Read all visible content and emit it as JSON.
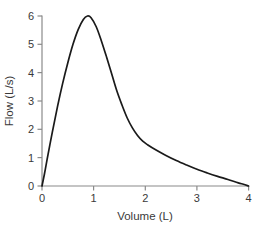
{
  "chart_data": {
    "type": "line",
    "title": "",
    "xlabel": "Volume (L)",
    "ylabel": "Flow (L/s)",
    "xlim": [
      0,
      4
    ],
    "ylim": [
      0,
      6
    ],
    "xticks": [
      "0",
      "1",
      "2",
      "3",
      "4"
    ],
    "yticks": [
      "0",
      "1",
      "2",
      "3",
      "4",
      "5",
      "6"
    ],
    "xtick_values": [
      0,
      1,
      2,
      3,
      4
    ],
    "ytick_values": [
      0,
      1,
      2,
      3,
      4,
      5,
      6
    ],
    "grid": false,
    "legend": null,
    "series": [
      {
        "name": "Expiratory flow-volume curve",
        "color": "#1a1a1a",
        "x": [
          0.0,
          0.05,
          0.1,
          0.2,
          0.3,
          0.4,
          0.5,
          0.6,
          0.7,
          0.8,
          0.88,
          0.95,
          1.05,
          1.15,
          1.25,
          1.35,
          1.45,
          1.55,
          1.65,
          1.75,
          1.85,
          1.95,
          2.05,
          2.2,
          2.4,
          2.6,
          2.8,
          3.0,
          3.2,
          3.4,
          3.6,
          3.8,
          3.9,
          4.0
        ],
        "y": [
          0.0,
          0.45,
          0.95,
          1.9,
          2.8,
          3.62,
          4.35,
          5.0,
          5.52,
          5.88,
          6.0,
          5.94,
          5.62,
          5.12,
          4.55,
          3.95,
          3.35,
          2.85,
          2.4,
          2.05,
          1.78,
          1.58,
          1.45,
          1.28,
          1.08,
          0.9,
          0.74,
          0.59,
          0.46,
          0.34,
          0.23,
          0.11,
          0.06,
          0.0
        ]
      }
    ]
  },
  "axes": {
    "x_title": "Volume (L)",
    "y_title": "Flow (L/s)",
    "axis_color": "#8a8a8a",
    "text_color": "#3a3a3a"
  },
  "ticks": {
    "x": [
      {
        "label": "0"
      },
      {
        "label": "1"
      },
      {
        "label": "2"
      },
      {
        "label": "3"
      },
      {
        "label": "4"
      }
    ],
    "y": [
      {
        "label": "0"
      },
      {
        "label": "1"
      },
      {
        "label": "2"
      },
      {
        "label": "3"
      },
      {
        "label": "4"
      },
      {
        "label": "5"
      },
      {
        "label": "6"
      }
    ]
  }
}
